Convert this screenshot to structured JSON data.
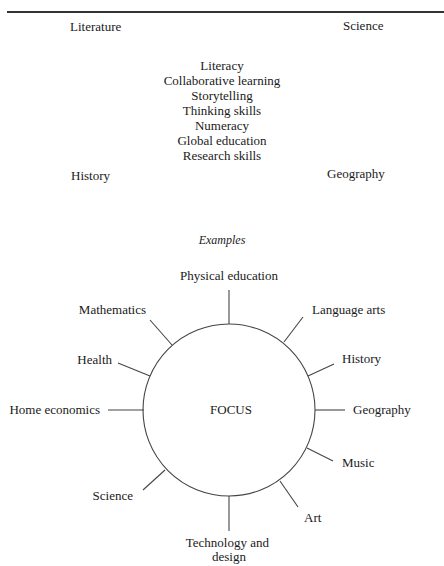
{
  "top_section": {
    "corners": {
      "top_left": "Literature",
      "top_right": "Science",
      "bottom_left": "History",
      "bottom_right": "Geography"
    },
    "center_list": [
      "Literacy",
      "Collaborative learning",
      "Storytelling",
      "Thinking skills",
      "Numeracy",
      "Global education",
      "Research skills"
    ]
  },
  "examples_label": "Examples",
  "focus_diagram": {
    "center_label": "FOCUS",
    "spokes": [
      {
        "label": "Physical education",
        "angle_deg": 90
      },
      {
        "label": "Language arts",
        "angle_deg": 52
      },
      {
        "label": "History",
        "angle_deg": 23
      },
      {
        "label": "Geography",
        "angle_deg": 0
      },
      {
        "label": "Music",
        "angle_deg": -25
      },
      {
        "label": "Art",
        "angle_deg": -55
      },
      {
        "label": "Technology and design",
        "angle_deg": -90
      },
      {
        "label": "Science",
        "angle_deg": -135
      },
      {
        "label": "Home economics",
        "angle_deg": 180
      },
      {
        "label": "Health",
        "angle_deg": 155
      },
      {
        "label": "Mathematics",
        "angle_deg": 127
      }
    ]
  }
}
